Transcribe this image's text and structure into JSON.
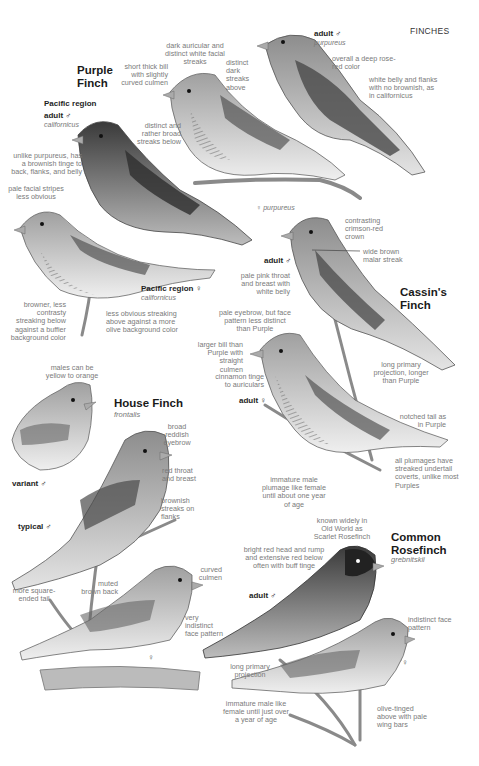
{
  "section_header": "FINCHES",
  "species": {
    "purple_finch": {
      "title_line1": "Purple",
      "title_line2": "Finch",
      "pacific_male": {
        "region": "Pacific region",
        "label": "adult ♂",
        "subspecies": "californicus"
      },
      "adult_male": {
        "label": "adult ♂",
        "subspecies": "purpureus"
      },
      "female_purpureus": {
        "symbol": "♀",
        "subspecies": "purpureus"
      },
      "pacific_female": {
        "label": "Pacific region ♀",
        "subspecies": "californicus"
      },
      "notes": {
        "dark_auricular": "dark auricular and distinct white facial streaks",
        "short_bill": "short thick bill with slightly curved culmen",
        "distinct_dark_streaks": "distinct dark streaks above",
        "broad_streaks": "distinct and rather broad streaks below",
        "rose_red": "overall a deep rose-red color",
        "white_belly": "white belly and flanks with no brownish, as in californicus",
        "brownish_tinge": "unlike purpureus, has a brownish tinge to back, flanks, and belly",
        "pale_facial": "pale facial stripes less obvious",
        "browner": "browner, less contrasty streaking below against a buffier background color",
        "less_obvious": "less obvious streaking above against a more olive background color"
      }
    },
    "cassins_finch": {
      "title_line1": "Cassin's",
      "title_line2": "Finch",
      "male": {
        "label": "adult ♂"
      },
      "female": {
        "label": "adult ♀"
      },
      "notes": {
        "crimson_crown": "contrasting crimson-red crown",
        "malar": "wide brown malar streak",
        "pale_pink": "pale pink throat and breast with white belly",
        "pale_eyebrow": "pale eyebrow, but face pattern less distinct than Purple",
        "larger_bill": "larger bill than Purple with straight culmen",
        "long_primary": "long primary projection, longer than Purple",
        "cinnamon": "cinnamon tinge to auriculars",
        "notched_tail": "notched tail as in Purple",
        "undertail": "all plumages have streaked undertail coverts, unlike most Purples",
        "immature": "immature male plumage like female until about one year of age"
      }
    },
    "house_finch": {
      "title": "House Finch",
      "subspecies": "frontalis",
      "variant": {
        "label": "variant ♂"
      },
      "typical": {
        "label": "typical ♂"
      },
      "female": {
        "symbol": "♀"
      },
      "notes": {
        "yellow": "males can be yellow to orange",
        "eyebrow": "broad reddish eyebrow",
        "red_throat": "red throat and breast",
        "brownish_streaks": "brownish streaks on flanks",
        "square_tail": "more square-ended tail",
        "muted_back": "muted brown back",
        "curved_culmen": "curved culmen",
        "indistinct_face": "very indistinct face pattern"
      }
    },
    "common_rosefinch": {
      "title_line1": "Common",
      "title_line2": "Rosefinch",
      "subspecies": "grebnitskii",
      "male": {
        "label": "adult ♂"
      },
      "female": {
        "symbol": "♀"
      },
      "notes": {
        "known_widely": "known widely in Old World as Scarlet Rosefinch",
        "bright_red": "bright red head and rump and extensive red below often with buff tinge",
        "indistinct_face": "indistinct face pattern",
        "long_primary": "long primary projection",
        "immature": "immature male like female until just over a year of age",
        "olive_tinged": "olive-tinged above with pale wing bars"
      }
    }
  },
  "colors": {
    "background": "#ffffff",
    "title_text": "#1a1a1a",
    "note_text": "#7a7a7a"
  }
}
